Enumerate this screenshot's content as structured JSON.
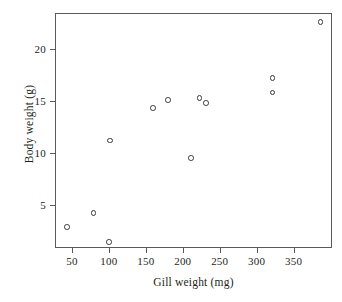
{
  "chart_data": {
    "type": "scatter",
    "title": "",
    "xlabel": "Gill weight (mg)",
    "ylabel": "Body weight (g)",
    "xlim": [
      27,
      402
    ],
    "ylim": [
      0.8,
      23.5
    ],
    "xticks": [
      50,
      100,
      150,
      200,
      250,
      300,
      350
    ],
    "xtick_labels": [
      "50",
      "100",
      "150",
      "200",
      "250",
      "300",
      "350"
    ],
    "yticks": [
      5,
      10,
      15,
      20
    ],
    "ytick_labels": [
      "5",
      "10",
      "15",
      "20"
    ],
    "grid": false,
    "legend": null,
    "marker": "open-circle",
    "marker_color": "#3a3a3a",
    "frame_color": "#5a5a5a",
    "points": [
      {
        "x": 42,
        "y": 2.9
      },
      {
        "x": 78,
        "y": 4.3
      },
      {
        "x": 99,
        "y": 1.5
      },
      {
        "x": 100,
        "y": 11.3
      },
      {
        "x": 158,
        "y": 14.4
      },
      {
        "x": 179,
        "y": 15.2
      },
      {
        "x": 210,
        "y": 9.6
      },
      {
        "x": 221,
        "y": 15.4
      },
      {
        "x": 230,
        "y": 14.9
      },
      {
        "x": 320,
        "y": 17.3
      },
      {
        "x": 320,
        "y": 15.9
      },
      {
        "x": 385,
        "y": 22.7
      }
    ]
  }
}
